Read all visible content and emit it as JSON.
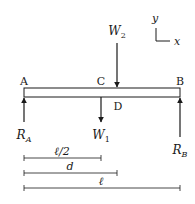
{
  "diagram": {
    "type": "beam-free-body",
    "colors": {
      "stroke": "#1a1a1a",
      "background": "#ffffff"
    },
    "axes": {
      "y_label": "y",
      "x_label": "x"
    },
    "points": {
      "A": "A",
      "B": "B",
      "C": "C",
      "D": "D"
    },
    "forces": {
      "W2": {
        "base": "W",
        "sub": "2",
        "direction": "down"
      },
      "W1": {
        "base": "W",
        "sub": "1",
        "direction": "down"
      },
      "RA": {
        "base": "R",
        "sub": "A",
        "direction": "up"
      },
      "RB": {
        "base": "R",
        "sub": "B",
        "direction": "up"
      }
    },
    "dimensions": [
      {
        "label": "ℓ/2",
        "from": "A",
        "to": "C"
      },
      {
        "label": "d",
        "from": "A",
        "to": "W2"
      },
      {
        "label": "ℓ",
        "from": "A",
        "to": "B"
      }
    ]
  }
}
